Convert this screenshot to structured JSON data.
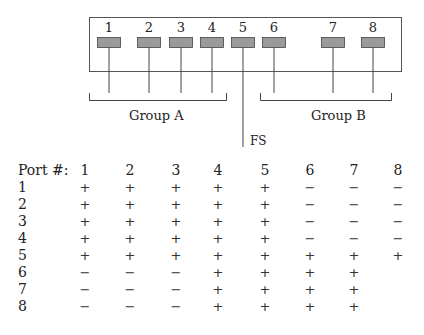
{
  "diagram": {
    "ports": [
      {
        "label": "1",
        "x": 97
      },
      {
        "label": "2",
        "x": 137
      },
      {
        "label": "3",
        "x": 169
      },
      {
        "label": "4",
        "x": 200
      },
      {
        "label": "5",
        "x": 231
      },
      {
        "label": "6",
        "x": 262
      },
      {
        "label": "7",
        "x": 321
      },
      {
        "label": "8",
        "x": 361
      }
    ],
    "groups": [
      {
        "label": "Group A",
        "ports": [
          "1",
          "2",
          "3",
          "4"
        ]
      },
      {
        "label": "Group B",
        "ports": [
          "6",
          "7",
          "8"
        ]
      }
    ],
    "fs_label": "FS",
    "port_fill_color": "#9a9a9a"
  },
  "table": {
    "header_label": "Port #:",
    "columns": [
      "1",
      "2",
      "3",
      "4",
      "5",
      "6",
      "7",
      "8"
    ],
    "rows": [
      {
        "label": "1",
        "cells": [
          "+",
          "+",
          "+",
          "+",
          "+",
          "−",
          "−",
          "−"
        ]
      },
      {
        "label": "2",
        "cells": [
          "+",
          "+",
          "+",
          "+",
          "+",
          "−",
          "−",
          "−"
        ]
      },
      {
        "label": "3",
        "cells": [
          "+",
          "+",
          "+",
          "+",
          "+",
          "−",
          "−",
          "−"
        ]
      },
      {
        "label": "4",
        "cells": [
          "+",
          "+",
          "+",
          "+",
          "+",
          "−",
          "−",
          "−"
        ]
      },
      {
        "label": "5",
        "cells": [
          "+",
          "+",
          "+",
          "+",
          "+",
          "+",
          "+",
          "+"
        ]
      },
      {
        "label": "6",
        "cells": [
          "−",
          "−",
          "−",
          "+",
          "+",
          "+",
          "+",
          ""
        ]
      },
      {
        "label": "7",
        "cells": [
          "−",
          "−",
          "−",
          "+",
          "+",
          "+",
          "+",
          ""
        ]
      },
      {
        "label": "8",
        "cells": [
          "−",
          "−",
          "−",
          "+",
          "+",
          "+",
          "+",
          ""
        ]
      }
    ]
  }
}
